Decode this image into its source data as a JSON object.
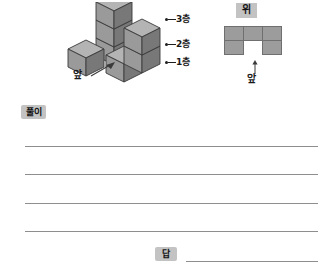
{
  "figure": {
    "solid": {
      "name": "isometric-cube-stack",
      "description": "stacked unit cubes shown in isometric view",
      "cube_count": 6,
      "colors": {
        "top_face": "#b4b4b4",
        "left_face": "#9a9a9a",
        "right_face": "#787878",
        "outline": "#3a3a3a"
      },
      "layer_labels": [
        {
          "id": "layer-3",
          "label": "3층"
        },
        {
          "id": "layer-2",
          "label": "2층"
        },
        {
          "id": "layer-1",
          "label": "1층"
        }
      ],
      "front_label": "앞"
    },
    "top_view": {
      "name": "top-view-grid",
      "heading": "위",
      "front_label": "앞",
      "columns": 3,
      "rows": 2,
      "cells": [
        [
          true,
          true,
          true
        ],
        [
          true,
          false,
          true
        ]
      ],
      "colors": {
        "fill": "#9c9c9c",
        "border": "#6f6f6f",
        "heading_background": "#c3c3c3"
      }
    }
  },
  "worksheet": {
    "solution_label": "풀이",
    "answer_label": "답",
    "rule_count": 4,
    "colors": {
      "rule": "#8e8e8e",
      "label_background": "#c3c3c3"
    }
  }
}
